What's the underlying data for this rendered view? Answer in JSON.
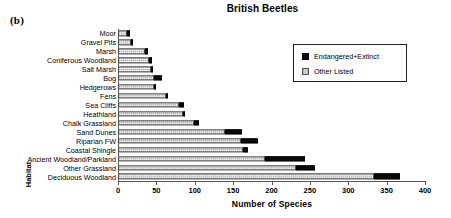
{
  "panel_label": "(b)",
  "chart_data": {
    "type": "bar",
    "orientation": "horizontal",
    "stacked": true,
    "title": "British Beetles",
    "xlabel": "Number of Species",
    "ylabel": "Habitat",
    "xlim": [
      0,
      400
    ],
    "xticks": [
      0,
      50,
      100,
      150,
      200,
      250,
      300,
      350,
      400
    ],
    "grid": false,
    "legend_position": "upper right",
    "categories": [
      "Moor",
      "Gravel Pits",
      "Marsh",
      "Coniferous Woodland",
      "Salt Marsh",
      "Bog",
      "Hedgerows",
      "Fens",
      "Sea Cliffs",
      "Heathland",
      "Chalk Grassland",
      "Sand Dunes",
      "Riparian FW",
      "Coastal Shingle",
      "Ancient Woodland/Parkland",
      "Other Grassland",
      "Deciduous Woodland"
    ],
    "series": [
      {
        "name": "Other Listed",
        "color": "#d2d2d2",
        "values": [
          12,
          19,
          35,
          40,
          44,
          47,
          49,
          63,
          80,
          85,
          99,
          139,
          160,
          163,
          192,
          232,
          334
        ]
      },
      {
        "name": "Endangered+Extinct",
        "color": "#0a0a0a",
        "values": [
          4,
          1,
          4,
          4,
          1,
          10,
          1,
          2,
          6,
          2,
          6,
          23,
          22,
          7,
          52,
          25,
          33
        ]
      }
    ],
    "totals": [
      16,
      20,
      39,
      44,
      45,
      57,
      50,
      65,
      86,
      87,
      105,
      162,
      182,
      170,
      244,
      257,
      367
    ]
  },
  "legend": {
    "items": [
      {
        "label": "Endangered+Extinct",
        "swatch": "black"
      },
      {
        "label": "Other Listed",
        "swatch": "gray"
      }
    ]
  }
}
